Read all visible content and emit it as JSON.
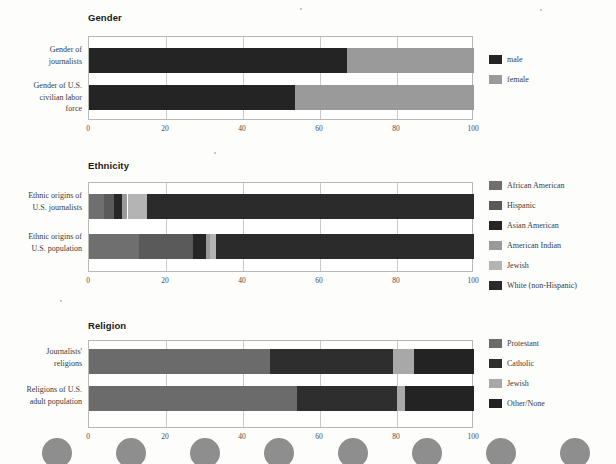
{
  "page": {
    "background": "#fdfdfc",
    "axis_ticks": [
      "0",
      "20",
      "40",
      "60",
      "80",
      "100"
    ],
    "axis_min": 0,
    "axis_max": 100
  },
  "colors": {
    "dark": "#2b2b2b",
    "near_black": "#1f1f1f",
    "mid_gray": "#6f6f6f",
    "gray": "#8b8b8b",
    "light_gray": "#a8a8a8",
    "pale_gray": "#c2c2c2",
    "grid": "#c9c9c9",
    "frame": "#b9b9b9",
    "text": "#3a3a3a"
  },
  "charts": [
    {
      "id": "gender",
      "title": "Gender",
      "categories": [
        "Gender of\njournalists",
        "Gender of U.S.\ncivilian labor\nforce"
      ],
      "legend": [
        {
          "label": "male",
          "color": "#242424"
        },
        {
          "label": "female",
          "color": "#9a9a9a"
        }
      ],
      "series": [
        {
          "name": "male",
          "values": [
            67,
            53.5
          ],
          "color": "#242424"
        },
        {
          "name": "female",
          "values": [
            33,
            46.5
          ],
          "color": "#9a9a9a"
        }
      ]
    },
    {
      "id": "ethnicity",
      "title": "Ethnicity",
      "categories": [
        "Ethnic origins of\nU.S. journalists",
        "Ethnic origins of\nU.S. population"
      ],
      "legend": [
        {
          "label": "African American",
          "color": "#6f6f6f"
        },
        {
          "label": "Hispanic",
          "color": "#5a5a5a"
        },
        {
          "label": "Asian American",
          "color": "#262626"
        },
        {
          "label": "American Indian",
          "color": "#9a9a9a"
        },
        {
          "label": "Jewish",
          "color": "#b4b4b4"
        },
        {
          "label": "White (non-Hispanic)",
          "color": "#2b2b2b"
        }
      ],
      "series": [
        {
          "name": "African American",
          "values": [
            4,
            13
          ],
          "color": "#6f6f6f"
        },
        {
          "name": "Hispanic",
          "values": [
            2.5,
            14
          ],
          "color": "#5a5a5a"
        },
        {
          "name": "Asian American",
          "values": [
            2,
            3.5
          ],
          "color": "#262626"
        },
        {
          "name": "American Indian",
          "values": [
            1.5,
            1
          ],
          "color": "#9a9a9a"
        },
        {
          "name": "Jewish",
          "values": [
            5,
            1.5
          ],
          "color": "#b4b4b4"
        },
        {
          "name": "White (non-Hispanic)",
          "values": [
            85,
            67
          ],
          "color": "#2b2b2b"
        }
      ]
    },
    {
      "id": "religion",
      "title": "Religion",
      "categories": [
        "Journalists'\nreligions",
        "Religions of U.S.\nadult population"
      ],
      "legend": [
        {
          "label": "Protestant",
          "color": "#6b6b6b"
        },
        {
          "label": "Catholic",
          "color": "#2e2e2e"
        },
        {
          "label": "Jewish",
          "color": "#a8a8a8"
        },
        {
          "label": "Other/None",
          "color": "#232323"
        }
      ],
      "series": [
        {
          "name": "Protestant",
          "values": [
            47,
            54
          ],
          "color": "#6b6b6b"
        },
        {
          "name": "Catholic",
          "values": [
            32,
            26
          ],
          "color": "#2e2e2e"
        },
        {
          "name": "Jewish",
          "values": [
            5.5,
            2
          ],
          "color": "#a8a8a8"
        },
        {
          "name": "Other/None",
          "values": [
            15.5,
            18
          ],
          "color": "#232323"
        }
      ]
    }
  ],
  "footer_circles": {
    "count": 8,
    "color": "#8e8e8e"
  },
  "chart_data": [
    {
      "type": "bar",
      "orientation": "horizontal",
      "stacked": true,
      "percent": true,
      "title": "Gender",
      "xlabel": "",
      "ylabel": "",
      "xlim": [
        0,
        100
      ],
      "grid": true,
      "legend_position": "right",
      "categories": [
        "Gender of journalists",
        "Gender of U.S. civilian labor force"
      ],
      "tick_labels": [
        "0",
        "20",
        "40",
        "60",
        "80",
        "100"
      ],
      "series": [
        {
          "name": "male",
          "values": [
            67,
            53.5
          ]
        },
        {
          "name": "female",
          "values": [
            33,
            46.5
          ]
        }
      ]
    },
    {
      "type": "bar",
      "orientation": "horizontal",
      "stacked": true,
      "percent": true,
      "title": "Ethnicity",
      "xlabel": "",
      "ylabel": "",
      "xlim": [
        0,
        100
      ],
      "grid": true,
      "legend_position": "right",
      "categories": [
        "Ethnic origins of U.S. journalists",
        "Ethnic origins of U.S. population"
      ],
      "tick_labels": [
        "0",
        "20",
        "40",
        "60",
        "80",
        "100"
      ],
      "series": [
        {
          "name": "African American",
          "values": [
            4,
            13
          ]
        },
        {
          "name": "Hispanic",
          "values": [
            2.5,
            14
          ]
        },
        {
          "name": "Asian American",
          "values": [
            2,
            3.5
          ]
        },
        {
          "name": "American Indian",
          "values": [
            1.5,
            1
          ]
        },
        {
          "name": "Jewish",
          "values": [
            5,
            1.5
          ]
        },
        {
          "name": "White (non-Hispanic)",
          "values": [
            85,
            67
          ]
        }
      ]
    },
    {
      "type": "bar",
      "orientation": "horizontal",
      "stacked": true,
      "percent": true,
      "title": "Religion",
      "xlabel": "",
      "ylabel": "",
      "xlim": [
        0,
        100
      ],
      "grid": true,
      "legend_position": "right",
      "categories": [
        "Journalists' religions",
        "Religions of U.S. adult population"
      ],
      "tick_labels": [
        "0",
        "20",
        "40",
        "60",
        "80",
        "100"
      ],
      "series": [
        {
          "name": "Protestant",
          "values": [
            47,
            54
          ]
        },
        {
          "name": "Catholic",
          "values": [
            32,
            26
          ]
        },
        {
          "name": "Jewish",
          "values": [
            5.5,
            2
          ]
        },
        {
          "name": "Other/None",
          "values": [
            15.5,
            18
          ]
        }
      ]
    }
  ]
}
